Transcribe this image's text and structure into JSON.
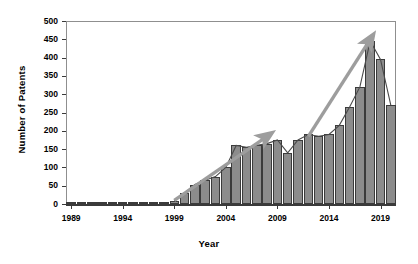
{
  "chart_data": {
    "type": "bar",
    "title": "",
    "xlabel": "Year",
    "ylabel": "Number of Patents",
    "ylim": [
      0,
      500
    ],
    "ytick_values": [
      0,
      50,
      100,
      150,
      200,
      250,
      300,
      350,
      400,
      450,
      500
    ],
    "xtick_labels": [
      "1989",
      "1994",
      "1999",
      "2004",
      "2009",
      "2014",
      "2019"
    ],
    "xtick_values": [
      1989,
      1994,
      1999,
      2004,
      2009,
      2014,
      2019
    ],
    "xlim": [
      1988.5,
      2020.5
    ],
    "grid": false,
    "legend": false,
    "legend_position": "none",
    "bar_fill_color": "#8c8c8c",
    "bar_edge_color": "#3b3b3b",
    "categories": [
      1989,
      1990,
      1991,
      1992,
      1993,
      1994,
      1995,
      1996,
      1997,
      1998,
      1999,
      2000,
      2001,
      2002,
      2003,
      2004,
      2005,
      2006,
      2007,
      2008,
      2009,
      2010,
      2011,
      2012,
      2013,
      2014,
      2015,
      2016,
      2017,
      2018,
      2019,
      2020
    ],
    "values": [
      1,
      1,
      2,
      2,
      3,
      4,
      3,
      3,
      4,
      5,
      8,
      30,
      53,
      65,
      75,
      100,
      160,
      155,
      160,
      165,
      175,
      140,
      175,
      190,
      185,
      190,
      215,
      265,
      320,
      445,
      395,
      270
    ],
    "series": [
      {
        "name": "Number of Patents",
        "values": [
          1,
          1,
          2,
          2,
          3,
          4,
          3,
          3,
          4,
          5,
          8,
          30,
          53,
          65,
          75,
          100,
          160,
          155,
          160,
          165,
          175,
          140,
          175,
          190,
          185,
          190,
          215,
          265,
          320,
          445,
          395,
          270
        ]
      }
    ],
    "annotations": [
      {
        "name": "growth-arrow-1",
        "type": "arrow",
        "x_start": 1999,
        "y_start": 10,
        "x_end": 2008,
        "y_end": 185,
        "color": "#9d9d9d"
      },
      {
        "name": "growth-arrow-2",
        "type": "arrow",
        "x_start": 2012,
        "y_start": 185,
        "x_end": 2018,
        "y_end": 450,
        "color": "#9d9d9d"
      }
    ]
  },
  "axes": {
    "y_title": "Number of Patents",
    "x_title": "Year"
  }
}
